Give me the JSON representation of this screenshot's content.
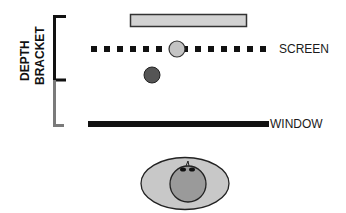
{
  "diagram": {
    "labels": {
      "screen": "SCREEN",
      "window": "WINDOW",
      "bracket_line1": "DEPTH",
      "bracket_line2": "BRACKET"
    },
    "colors": {
      "black": "#111111",
      "bracket_gray": "#7a7a7a",
      "light_fill": "#cfcfcf",
      "dark_ball": "#555555",
      "head_fill": "#999999",
      "outline": "#333333"
    },
    "elements": [
      {
        "name": "far-plane-bar",
        "type": "rect"
      },
      {
        "name": "screen-plane",
        "type": "dotted-line"
      },
      {
        "name": "on-screen-object",
        "type": "circle",
        "fill": "light"
      },
      {
        "name": "in-front-object",
        "type": "circle",
        "fill": "dark"
      },
      {
        "name": "window-plane",
        "type": "solid-line"
      },
      {
        "name": "viewer-head",
        "type": "ellipse+circle"
      },
      {
        "name": "depth-bracket",
        "type": "bracket",
        "segments": [
          "black (upper)",
          "gray (lower)"
        ]
      }
    ]
  }
}
